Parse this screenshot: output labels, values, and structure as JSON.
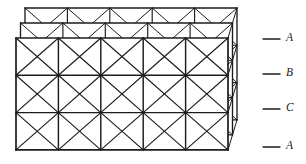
{
  "figure": {
    "name": "close-packed-layer-stacking-diagram",
    "line_color": "#1c1c1c",
    "background_color": "#ffffff",
    "stroke_width": 1.1,
    "plane_count": 3,
    "grid_columns": 5,
    "grid_rows": 3,
    "cell_division": "both-diagonals-four-triangles",
    "plane_offset_x": -4.5,
    "plane_offset_y": -15,
    "front_plane": {
      "left": 16,
      "top": 38,
      "right": 228,
      "bottom": 150
    }
  },
  "labels": [
    {
      "text": "A",
      "leader_x1": 263,
      "leader_x2": 280,
      "y": 39,
      "label_x": 286
    },
    {
      "text": "B",
      "leader_x1": 263,
      "leader_x2": 280,
      "y": 74,
      "label_x": 286
    },
    {
      "text": "C",
      "leader_x1": 263,
      "leader_x2": 280,
      "y": 109,
      "label_x": 286
    },
    {
      "text": "A",
      "leader_x1": 263,
      "leader_x2": 280,
      "y": 147,
      "label_x": 286
    }
  ],
  "chart_data": {
    "type": "diagram",
    "title": "",
    "stacking_sequence": [
      "A",
      "B",
      "C",
      "A"
    ],
    "layers": [
      {
        "id": "back",
        "label": "A",
        "origin_x": 25,
        "origin_y": 8
      },
      {
        "id": "middle",
        "label": "B",
        "origin_x": 20.5,
        "origin_y": 23
      },
      {
        "id": "front",
        "label": "C",
        "origin_x": 16,
        "origin_y": 38
      }
    ],
    "cell_width": 42.4,
    "cell_height": 37.3
  }
}
